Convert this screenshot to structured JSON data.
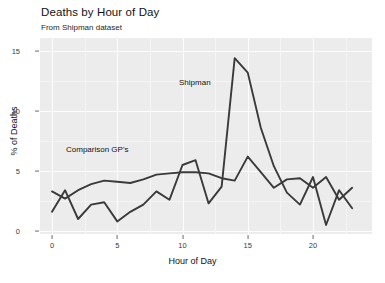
{
  "chart_data": {
    "type": "line",
    "title": "Deaths by Hour of Day",
    "subtitle": "From Shipman dataset",
    "xlabel": "Hour of Day",
    "ylabel": "% of Deaths",
    "xlim": [
      0,
      23
    ],
    "ylim": [
      0,
      15.8
    ],
    "grid": true,
    "legend_position": "inline-annotations",
    "x": [
      0,
      1,
      2,
      3,
      4,
      5,
      6,
      7,
      8,
      9,
      10,
      11,
      12,
      13,
      14,
      15,
      16,
      17,
      18,
      19,
      20,
      21,
      22,
      23
    ],
    "xticks": [
      0,
      5,
      10,
      15,
      20
    ],
    "yticks": [
      0,
      5,
      10,
      15
    ],
    "series": [
      {
        "name": "Shipman",
        "color": "#3a3a3a",
        "values": [
          1.6,
          3.4,
          1.0,
          2.2,
          2.4,
          0.8,
          1.6,
          2.2,
          3.3,
          2.6,
          5.5,
          5.9,
          2.3,
          3.7,
          14.4,
          13.2,
          8.6,
          5.4,
          3.2,
          2.2,
          4.5,
          0.5,
          3.4,
          1.9
        ]
      },
      {
        "name": "Comparison GP's",
        "color": "#3a3a3a",
        "values": [
          3.3,
          2.7,
          3.4,
          3.9,
          4.2,
          4.1,
          4.0,
          4.3,
          4.7,
          4.8,
          4.9,
          4.9,
          4.8,
          4.4,
          4.2,
          6.2,
          4.9,
          3.6,
          4.3,
          4.4,
          3.6,
          4.5,
          2.6,
          3.6
        ]
      }
    ],
    "annotations": [
      {
        "label": "Shipman",
        "x": 14,
        "y": 11.5
      },
      {
        "label": "Comparison GP's",
        "x": 2,
        "y": 6.8
      }
    ]
  },
  "axis": {
    "y_tick_labels": [
      "0",
      "5",
      "10",
      "15"
    ],
    "x_tick_labels": [
      "0",
      "5",
      "10",
      "15",
      "20"
    ]
  },
  "colors": {
    "panel_background": "#ececed",
    "gridline": "#fdfdfd",
    "line": "#3a3a3a",
    "page_background": "#ffffff"
  }
}
